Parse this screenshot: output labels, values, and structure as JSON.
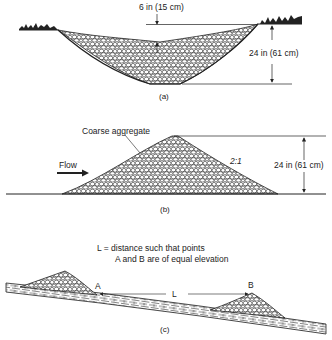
{
  "panel_a": {
    "caption": "(a)",
    "dim_top": "6 in (15 cm)",
    "dim_depth": "24 in (61 cm)"
  },
  "panel_b": {
    "caption": "(b)",
    "material_label": "Coarse aggregate",
    "flow_label": "Flow",
    "slope_label": "2:1",
    "dim_height": "24 in (61 cm)"
  },
  "panel_c": {
    "caption": "(c)",
    "note_line1": "L = distance such that points",
    "note_line2": "A and B are of equal elevation",
    "point_a": "A",
    "point_b": "B",
    "distance_label": "L"
  },
  "colors": {
    "ink": "#222222",
    "background": "#ffffff"
  }
}
